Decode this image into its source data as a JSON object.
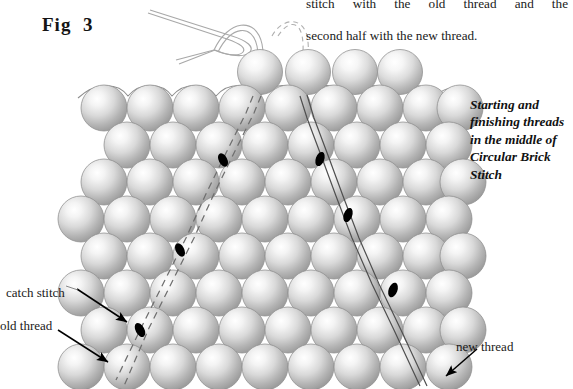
{
  "figure": {
    "label": "Fig  3",
    "domain_note": "beadwork instructional diagram"
  },
  "body_text": {
    "line1": "stitch with the old thread and the",
    "line2": "second half with the new thread."
  },
  "caption": {
    "text": "Starting and finishing threads in the middle of Circular Brick Stitch"
  },
  "annotations": [
    {
      "id": "catch-stitch",
      "label": "catch stitch"
    },
    {
      "id": "old-thread",
      "label": "old thread"
    },
    {
      "id": "new-thread",
      "label": "new thread"
    }
  ],
  "colors": {
    "background": "#ffffff",
    "text": "#1a1a1a",
    "bead_light": "#ffffff",
    "bead_mid": "#d3d3d3",
    "bead_dark": "#9a9a9a",
    "bead_edge": "#8d8d8d",
    "thread_line": "#4a4a4a",
    "thread_dash": "#6b6b6b",
    "stitch_marker": "#000000",
    "needle": "#b5b5b5",
    "arrow": "#000000"
  },
  "beadwork": {
    "stitch_type": "Circular Brick Stitch",
    "bead_diameter_px": 45,
    "row_pitch_px": 38,
    "rows": [
      {
        "index": 0,
        "y": 72,
        "x_start": 238,
        "count": 4,
        "offset": "indented"
      },
      {
        "index": 1,
        "y": 107,
        "x_start": 82,
        "count": 9,
        "offset": "flush"
      },
      {
        "index": 2,
        "y": 141,
        "x_start": 104,
        "count": 8,
        "offset": "half"
      },
      {
        "index": 3,
        "y": 176,
        "x_start": 82,
        "count": 9,
        "offset": "flush"
      },
      {
        "index": 4,
        "y": 210,
        "x_start": 104,
        "count": 8,
        "offset": "half"
      },
      {
        "index": 5,
        "y": 245,
        "x_start": 82,
        "count": 9,
        "offset": "flush"
      },
      {
        "index": 6,
        "y": 279,
        "x_start": 104,
        "count": 8,
        "offset": "half"
      },
      {
        "index": 7,
        "y": 314,
        "x_start": 82,
        "count": 9,
        "offset": "flush"
      },
      {
        "index": 8,
        "y": 348,
        "x_start": 104,
        "count": 8,
        "offset": "half"
      },
      {
        "index": 9,
        "y": 383,
        "x_start": 82,
        "count": 9,
        "offset": "flush"
      }
    ],
    "old_thread": {
      "style": "dashed",
      "description": "dashed line running diagonally down-left through bead column",
      "markers": [
        {
          "x": 219,
          "y": 157
        },
        {
          "x": 175,
          "y": 245
        },
        {
          "x": 133,
          "y": 329
        }
      ]
    },
    "new_thread": {
      "style": "solid-double",
      "description": "solid double line running diagonally down-right",
      "markers": [
        {
          "x": 320,
          "y": 159
        },
        {
          "x": 345,
          "y": 209
        },
        {
          "x": 392,
          "y": 288
        }
      ]
    },
    "needle": {
      "present": true,
      "description": "threaded needle entering top bead from upper left"
    }
  }
}
